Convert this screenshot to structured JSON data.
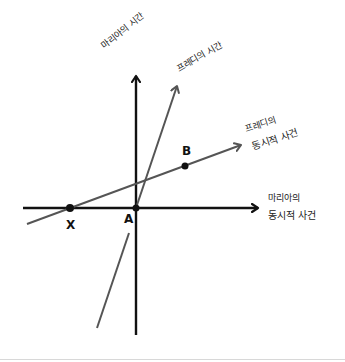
{
  "diagram": {
    "type": "spacetime-diagram",
    "axes": {
      "maria_time": "마리아의 시간",
      "fredi_time": "프레디의 시간",
      "fredi_simultaneous_line1": "프레디의",
      "fredi_simultaneous_line2": "동시적 사건",
      "maria_simultaneous_line1": "마리아의",
      "maria_simultaneous_line2": "동시적 사건"
    },
    "points": {
      "X": "X",
      "A": "A",
      "B": "B"
    },
    "colors": {
      "maria_axes": "#111111",
      "fredi_axes": "#555555",
      "background": "#ffffff"
    }
  }
}
